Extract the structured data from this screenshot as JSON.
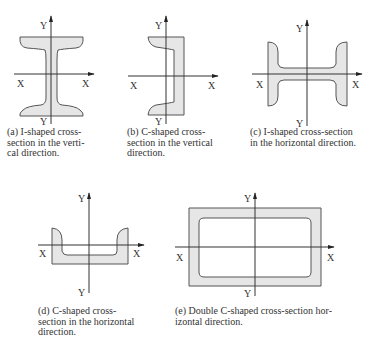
{
  "figure": {
    "panels": [
      {
        "id": "a",
        "axis_x": "X",
        "axis_y": "Y",
        "caption_lines": [
          "(a) I-shaped cross-",
          "section in the verti-",
          "cal direction."
        ],
        "caption": "(a) I-shaped cross-section in the vertical direction."
      },
      {
        "id": "b",
        "axis_x": "X",
        "axis_y": "Y",
        "caption_lines": [
          "(b) C-shaped cross-",
          "section in the vertical",
          "direction."
        ],
        "caption": "(b) C-shaped cross-section in the vertical direction."
      },
      {
        "id": "c",
        "axis_x": "X",
        "axis_y": "Y",
        "caption_lines": [
          "(c) I-shaped cross-section",
          "in the horizontal direction."
        ],
        "caption": "(c) I-shaped cross-section in the horizontal direction."
      },
      {
        "id": "d",
        "axis_x": "X",
        "axis_y": "Y",
        "caption_lines": [
          "(d) C-shaped cross-",
          "section in the horizontal",
          "direction."
        ],
        "caption": "(d) C-shaped cross-section in the horizontal direction."
      },
      {
        "id": "e",
        "axis_x": "X",
        "axis_y": "Y",
        "caption_lines": [
          "(e) Double C-shaped cross-section hor-",
          "izontal direction."
        ],
        "caption": "(e) Double C-shaped cross-section horizontal direction."
      }
    ],
    "colors": {
      "fill": "#e6e6e6",
      "outline": "#555555",
      "axis": "#333333"
    }
  }
}
